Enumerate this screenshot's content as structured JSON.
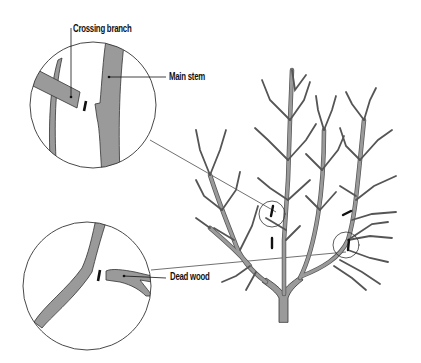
{
  "diagram": {
    "labels": {
      "crossing_branch": "Crossing branch",
      "main_stem": "Main stem",
      "dead_wood": "Dead wood"
    },
    "callouts": [
      {
        "id": "upper-detail",
        "shows": [
          "Crossing branch",
          "Main stem"
        ],
        "cut_marks": 1
      },
      {
        "id": "lower-detail",
        "shows": [
          "Dead wood"
        ],
        "cut_marks": 1
      }
    ],
    "tree_cut_marks": 4,
    "colors": {
      "branch_fill": "#9a9a9a",
      "outline": "#333333",
      "cut_mark": "#111111",
      "background": "#ffffff"
    }
  }
}
